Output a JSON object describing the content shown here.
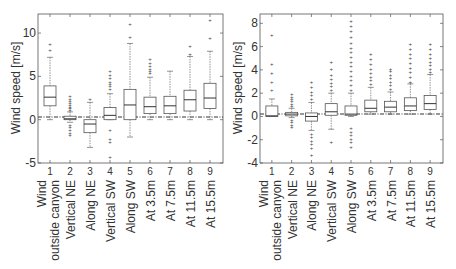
{
  "chart_data": [
    {
      "type": "box",
      "title": "",
      "xlabel": "",
      "ylabel": "Wind speed  [m/s]",
      "ylim": [
        -5,
        12.2
      ],
      "yticks": [
        -5,
        0,
        5,
        10
      ],
      "grid": false,
      "zero_line": true,
      "x_tick_labels": [
        "1",
        "2",
        "3",
        "4",
        "5",
        "6",
        "7",
        "8",
        "9"
      ],
      "categories": [
        "Wind outside canyon",
        "Vertical NE",
        "Along NE",
        "Vertical SW",
        "Along SW",
        "At 3.5m",
        "At 7.5m",
        "At 11.5m",
        "At 15.5m"
      ],
      "boxes": [
        {
          "q1": 1.6,
          "median": 2.6,
          "q3": 3.9,
          "whisker_low": 0.0,
          "whisker_high": 7.2,
          "outliers": [
            8.0,
            8.7
          ]
        },
        {
          "q1": 0.0,
          "median": 0.1,
          "q3": 0.4,
          "whisker_low": -0.3,
          "whisker_high": 0.9,
          "outliers": [
            1.1,
            1.3,
            1.5,
            1.7,
            1.9,
            2.1,
            2.4,
            2.7,
            -0.6,
            -0.9,
            -1.2,
            -1.5,
            -1.8
          ]
        },
        {
          "q1": -1.5,
          "median": -0.5,
          "q3": 0.0,
          "whisker_low": -3.2,
          "whisker_high": 2.0,
          "outliers": [
            2.4
          ]
        },
        {
          "q1": 0.0,
          "median": 0.5,
          "q3": 1.4,
          "whisker_low": 0.0,
          "whisker_high": 3.0,
          "outliers": [
            3.6,
            3.9,
            4.1,
            4.4,
            4.8,
            5.2,
            5.6,
            -1.2,
            -2.2,
            -2.6,
            -4.3
          ]
        },
        {
          "q1": 0.0,
          "median": 1.7,
          "q3": 3.5,
          "whisker_low": -2.0,
          "whisker_high": 8.8,
          "outliers": [
            9.6,
            11.0
          ]
        },
        {
          "q1": 0.7,
          "median": 1.5,
          "q3": 2.6,
          "whisker_low": 0.0,
          "whisker_high": 4.9,
          "outliers": [
            5.4,
            5.6,
            5.8,
            6.2,
            6.6,
            7.0
          ]
        },
        {
          "q1": 0.7,
          "median": 1.6,
          "q3": 2.7,
          "whisker_low": 0.0,
          "whisker_high": 5.6,
          "outliers": []
        },
        {
          "q1": 1.0,
          "median": 2.3,
          "q3": 3.4,
          "whisker_low": 0.0,
          "whisker_high": 7.3,
          "outliers": [
            7.6,
            8.5
          ]
        },
        {
          "q1": 1.3,
          "median": 2.5,
          "q3": 4.2,
          "whisker_low": 0.0,
          "whisker_high": 7.9,
          "outliers": [
            9.4,
            11.5
          ]
        }
      ]
    },
    {
      "type": "box",
      "title": "",
      "xlabel": "",
      "ylabel": "Wind speed  [m/s]",
      "ylim": [
        -4,
        8.8
      ],
      "yticks": [
        -4,
        -2,
        0,
        2,
        4,
        6,
        8
      ],
      "grid": false,
      "zero_line": true,
      "x_tick_labels": [
        "1",
        "2",
        "3",
        "4",
        "5",
        "6",
        "7",
        "8",
        "9"
      ],
      "categories": [
        "Wind outside canyon",
        "Vertical NE",
        "Along NE",
        "Vertical SW",
        "Along SW",
        "At 3.5m",
        "At 7.5m",
        "At 11.5m",
        "At 15.5m"
      ],
      "boxes": [
        {
          "q1": 0.0,
          "median": 0.05,
          "q3": 0.9,
          "whisker_low": 0.0,
          "whisker_high": 1.5,
          "outliers": [
            2.3,
            3.0,
            3.7,
            4.5,
            7.0
          ]
        },
        {
          "q1": 0.05,
          "median": 0.2,
          "q3": 0.35,
          "whisker_low": -0.1,
          "whisker_high": 0.7,
          "outliers": [
            0.9,
            1.1,
            1.3,
            1.5,
            1.7,
            1.9,
            -0.3,
            -0.5,
            -0.7,
            -0.9
          ]
        },
        {
          "q1": -0.4,
          "median": 0.0,
          "q3": 0.3,
          "whisker_low": -1.2,
          "whisker_high": 1.2,
          "outliers": [
            1.5,
            1.8,
            2.1,
            2.5,
            3.0,
            -1.5,
            -1.8,
            -2.1,
            -2.4,
            -2.7,
            -3.3
          ]
        },
        {
          "q1": 0.1,
          "median": 0.4,
          "q3": 1.1,
          "whisker_low": -1.1,
          "whisker_high": 2.0,
          "outliers": [
            2.3,
            2.6,
            2.9,
            3.2,
            3.6,
            4.1,
            4.7,
            -2.2
          ]
        },
        {
          "q1": 0.1,
          "median": 0.2,
          "q3": 0.9,
          "whisker_low": 0.0,
          "whisker_high": 2.0,
          "outliers": [
            2.3,
            2.7,
            3.1,
            3.5,
            3.9,
            4.3,
            4.7,
            5.1,
            5.5,
            5.9,
            6.3,
            6.8,
            7.3,
            7.8,
            8.2,
            -1.0,
            -1.3,
            -1.6,
            -1.9,
            -2.2,
            -2.6
          ]
        },
        {
          "q1": 0.4,
          "median": 0.7,
          "q3": 1.4,
          "whisker_low": 0.2,
          "whisker_high": 2.5,
          "outliers": [
            2.8,
            3.1,
            3.4,
            3.7,
            4.1,
            4.5,
            4.9,
            5.4
          ]
        },
        {
          "q1": 0.4,
          "median": 0.8,
          "q3": 1.3,
          "whisker_low": 0.2,
          "whisker_high": 2.1,
          "outliers": [
            2.4,
            2.7,
            3.0,
            3.3,
            3.6,
            3.9,
            4.1
          ]
        },
        {
          "q1": 0.5,
          "median": 0.9,
          "q3": 1.6,
          "whisker_low": 0.2,
          "whisker_high": 2.8,
          "outliers": [
            3.0,
            3.4,
            3.8,
            4.2,
            4.6,
            5.0,
            5.4,
            5.8,
            6.2
          ]
        },
        {
          "q1": 0.6,
          "median": 1.1,
          "q3": 1.8,
          "whisker_low": 0.2,
          "whisker_high": 3.6,
          "outliers": [
            3.8,
            4.1,
            4.4,
            4.7,
            5.0,
            5.4,
            5.8,
            6.2
          ]
        }
      ]
    }
  ]
}
